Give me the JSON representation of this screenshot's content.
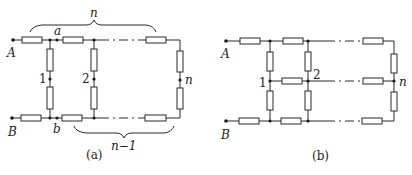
{
  "figure_a": {
    "caption": "(a)",
    "terminal_top": "A",
    "terminal_bottom": "B",
    "node_top": "a",
    "node_bottom": "b",
    "rung_labels": [
      "1",
      "2",
      "n"
    ],
    "brace_top_label": "n",
    "brace_bottom_label": "n−1"
  },
  "figure_b": {
    "caption": "(b)",
    "terminal_top": "A",
    "terminal_bottom": "B",
    "node_labels": [
      "1",
      "2",
      "n"
    ]
  },
  "colors": {
    "line": "#2a2a2a",
    "background": "#ffffff"
  }
}
